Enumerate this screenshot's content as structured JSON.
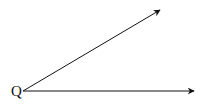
{
  "diagram": {
    "type": "angle",
    "vertex": {
      "label": "Q",
      "x": 23,
      "y": 91
    },
    "rays": [
      {
        "name": "upper-ray",
        "from": [
          23,
          91
        ],
        "to": [
          160,
          10
        ]
      },
      {
        "name": "lower-ray",
        "from": [
          23,
          91
        ],
        "to": [
          194,
          91
        ]
      }
    ],
    "stroke_color": "#111111",
    "background": "#ffffff"
  }
}
